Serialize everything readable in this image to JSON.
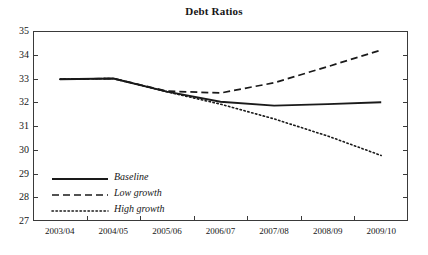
{
  "chart_data": {
    "type": "line",
    "title": "Debt Ratios",
    "xlabel": "",
    "ylabel": "",
    "categories": [
      "2003/04",
      "2004/05",
      "2005/06",
      "2006/07",
      "2007/08",
      "2008/09",
      "2009/10"
    ],
    "ylim": [
      27,
      35
    ],
    "yticks": [
      27,
      28,
      29,
      30,
      31,
      32,
      33,
      34,
      35
    ],
    "ytick_labels": [
      "27",
      "28",
      "29",
      "30",
      "31",
      "32",
      "33",
      "34",
      "35"
    ],
    "grid": false,
    "legend_position": "inside-bottom-left",
    "series": [
      {
        "name": "Baseline",
        "style": "solid",
        "color": "#1a1a1a",
        "values": [
          32.97,
          33.0,
          32.45,
          32.02,
          31.86,
          31.92,
          32.0
        ]
      },
      {
        "name": "Low growth",
        "style": "dashed",
        "color": "#1a1a1a",
        "values": [
          32.97,
          33.0,
          32.47,
          32.39,
          32.82,
          33.5,
          34.2
        ]
      },
      {
        "name": "High growth",
        "style": "dotted",
        "color": "#1a1a1a",
        "values": [
          32.97,
          33.0,
          32.44,
          31.92,
          31.3,
          30.58,
          29.76
        ]
      }
    ]
  },
  "legend": {
    "items": [
      {
        "label": "Baseline",
        "style": "solid"
      },
      {
        "label": "Low growth",
        "style": "dashed"
      },
      {
        "label": "High growth",
        "style": "dotted"
      }
    ]
  },
  "axis": {
    "y_labels": [
      "35",
      "34",
      "33",
      "32",
      "31",
      "30",
      "29",
      "28",
      "27"
    ],
    "x_labels": [
      "2003/04",
      "2004/05",
      "2005/06",
      "2006/07",
      "2007/08",
      "2008/09",
      "2009/10"
    ]
  }
}
